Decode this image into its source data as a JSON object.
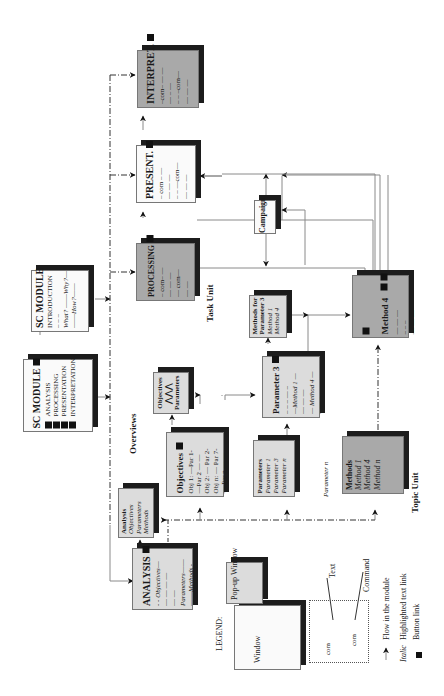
{
  "diagram": {
    "orientation": "rotated-90-ccw",
    "labels": {
      "overviews": "Overviews",
      "task_unit": "Task Unit",
      "topic_unit": "Topic Unit",
      "parameter_n_loose": "Parameter n"
    },
    "sc_module_main": {
      "title": "SC MODULE",
      "items": [
        "ANALYSIS",
        "PROCESSING",
        "PRESENTATION",
        "INTERPRETATION"
      ]
    },
    "sc_module_intro": {
      "title": "SC MODULE",
      "subtitle": "INTRODUCTION",
      "lines": [
        "What?",
        "Why?",
        "How?"
      ]
    },
    "analysis": {
      "title": "ANALYSIS",
      "lines": [
        "Objectives",
        "Parameters",
        "Methods"
      ]
    },
    "analysis_popup": {
      "lines": [
        "Analysis",
        "Objectives",
        "Parameters",
        "Methods"
      ]
    },
    "objectives": {
      "title": "Objectives",
      "lines": [
        "Obj 1: —Par 1-",
        "—Par 2 — —",
        "Obj 2: — Par 2-",
        "Obj n: — Par 7-",
        "— Par n — —"
      ]
    },
    "objectives_popup": {
      "lines": [
        "Objectives",
        "Parameters"
      ]
    },
    "parameters": {
      "title": "Parameters",
      "lines": [
        "Parameter 1",
        "Parameter 3",
        "Parameter n"
      ]
    },
    "parameter3": {
      "title": "Parameter 3",
      "lines": [
        "—Method 1 —",
        "— Method 4 —"
      ]
    },
    "methods_for_param": {
      "lines": [
        "Methods for",
        "Parameter 3",
        "Method 1",
        "Method 4"
      ]
    },
    "methods": {
      "title": "Methods",
      "lines": [
        "Method 1",
        "Method 4",
        "Method n"
      ]
    },
    "method4": {
      "title": "Method 4"
    },
    "processing": {
      "title": "PROCESSING",
      "lines": [
        "com",
        "com"
      ]
    },
    "campaign": {
      "title": "Campaign"
    },
    "present": {
      "title": "PRESENT.",
      "lines": [
        "com",
        "com"
      ]
    },
    "interpret": {
      "title": "INTERPRET.",
      "lines": [
        "com",
        "com"
      ]
    },
    "legend": {
      "title": "LEGEND:",
      "window": "Window",
      "popup": "Pop-up Window",
      "text_callout": "Text",
      "command_callout": "Command",
      "com1": "com",
      "com2": "com",
      "items": [
        {
          "symbol": "arrow",
          "label": "Flow in the module"
        },
        {
          "symbol": "Italic",
          "label": "Highlighted text link"
        },
        {
          "symbol": "square",
          "label": "Button link"
        }
      ]
    },
    "colors": {
      "white_box": "#fafafa",
      "light_box": "#dcdcdc",
      "dark_box": "#a9a9a9",
      "shadow": "#1c1c1c",
      "line": "#8a8a8a"
    }
  }
}
